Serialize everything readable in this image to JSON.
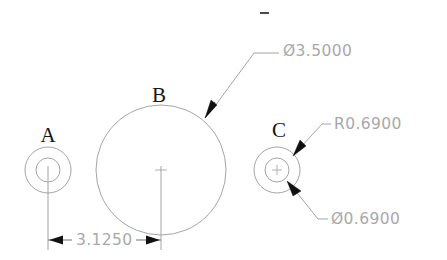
{
  "drawing": {
    "title": "Hole pattern dimension drawing",
    "background_color": "#ffffff",
    "line_color": "#9a9a9a",
    "dim_text_color": "#a9a9a9",
    "label_color": "#161616",
    "arrow_color": "#101010",
    "width": 447,
    "height": 260
  },
  "features": [
    {
      "id": "A",
      "label": "A",
      "kind": "counterbored-hole",
      "center_x": 48,
      "center_y": 170,
      "outer_radius": 23,
      "inner_radius": 12,
      "label_x": 48,
      "label_y": 137
    },
    {
      "id": "B",
      "label": "B",
      "kind": "circle",
      "center_x": 161,
      "center_y": 170,
      "outer_radius": 65,
      "inner_radius": 0,
      "label_x": 159,
      "label_y": 97
    },
    {
      "id": "C",
      "label": "C",
      "kind": "counterbored-hole",
      "center_x": 277,
      "center_y": 170,
      "outer_radius": 23,
      "inner_radius": 12,
      "label_x": 279,
      "label_y": 132
    }
  ],
  "callouts": [
    {
      "id": "diameter-3-5000",
      "text": "Ø3.5000",
      "text_x": 283,
      "text_y": 50,
      "leader": {
        "arrow_tip_x": 205,
        "arrow_tip_y": 117,
        "elbow_x": 254,
        "elbow_y": 53,
        "end_x": 279,
        "end_y": 53
      }
    },
    {
      "id": "radius-0-6900",
      "text": "R0.6900",
      "text_x": 334,
      "text_y": 124,
      "leader": {
        "arrow_tip_x": 294,
        "arrow_tip_y": 155,
        "elbow_x": 322,
        "elbow_y": 124,
        "end_x": 331,
        "end_y": 124
      }
    },
    {
      "id": "diameter-0-6900",
      "text": "Ø0.6900",
      "text_x": 331,
      "text_y": 219,
      "leader": {
        "arrow_tip_x": 288,
        "arrow_tip_y": 182,
        "elbow_x": 318,
        "elbow_y": 219,
        "end_x": 328,
        "end_y": 219
      }
    }
  ],
  "linear_dimension": {
    "id": "distance-a-to-b",
    "text": "3.1250",
    "value": 3.125,
    "text_x": 76,
    "text_y": 240,
    "line_y": 240,
    "left_x": 48,
    "right_x": 161,
    "ext_top_y": 176,
    "ext_bottom_y": 250
  },
  "stray_tick": {
    "id": "top-tick-mark",
    "x": 260,
    "y": 12,
    "width": 9,
    "height": 2
  }
}
